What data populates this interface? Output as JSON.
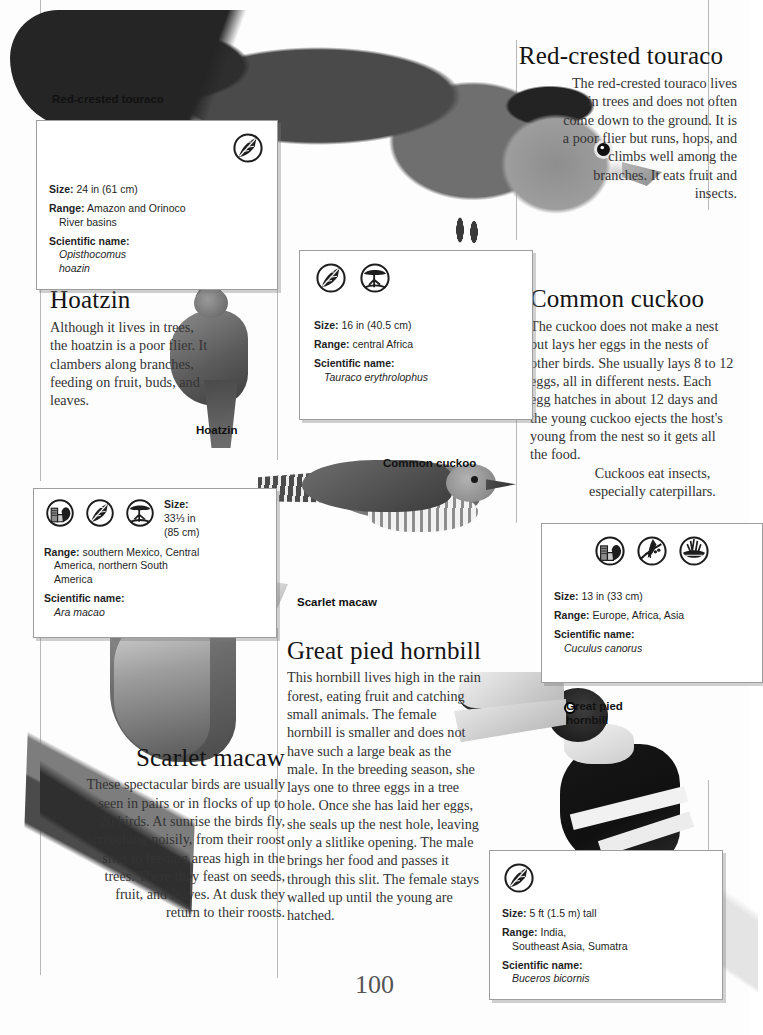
{
  "page": {
    "number": "100",
    "rules_color": "#b9b9b9"
  },
  "captions": [
    {
      "name": "caption-red-crested-touraco",
      "text": "Red-crested touraco"
    },
    {
      "name": "caption-hoatzin",
      "text": "Hoatzin"
    },
    {
      "name": "caption-common-cuckoo",
      "text": "Common cuckoo"
    },
    {
      "name": "caption-scarlet-macaw",
      "text": "Scarlet macaw"
    },
    {
      "name": "caption-great-pied-hornbill",
      "text": "Great pied\nhornbill"
    }
  ],
  "articles": {
    "touraco": {
      "title": "Red-crested touraco",
      "body": "The red-crested touraco lives in trees and does not often come down to the ground. It is a poor flier but runs, hops, and climbs well among the branches. It eats fruit and insects."
    },
    "hoatzin": {
      "title": "Hoatzin",
      "body": "Although it lives in trees, the hoatzin is a poor flier. It clambers along branches, feeding on fruit, buds, and leaves."
    },
    "cuckoo": {
      "title": "Common cuckoo",
      "body": "The cuckoo does not make a nest but lays her eggs in the nests of other birds. She usually lays 8 to 12 eggs, all in different nests. Each egg hatches in about 12 days and the young cuckoo ejects the host's young from the nest so it gets all the food.",
      "body2": "Cuckoos eat insects, especially caterpillars."
    },
    "macaw": {
      "title": "Scarlet macaw",
      "body": "These spectacular birds are usually seen in pairs or in flocks of up to 20 birds. At sunrise the birds fly, screeching noisily, from their roost sites to feeding areas high in the trees. There they feast on seeds, fruit, and leaves. At dusk they return to their roosts."
    },
    "hornbill": {
      "title": "Great pied hornbill",
      "body": "This hornbill lives high in the rain forest, eating fruit and catching small animals. The female hornbill is smaller and does not have such a large beak as the male. In the breeding season, she lays one to three eggs in a tree hole. Once she has laid her eggs, she seals up the nest hole, leaving only a slitlike opening. The male brings her food and passes it through this slit. The female stays walled up until the young are hatched."
    }
  },
  "factboxes": {
    "hoatzin": {
      "icons": [
        "rainforest-leaf-icon"
      ],
      "size_label": "Size:",
      "size_value": "24 in (61 cm)",
      "range_label": "Range:",
      "range_value": "Amazon and Orinoco",
      "range_value2": "River basins",
      "sciname_label": "Scientific name:",
      "sciname_value": "Opisthocomus",
      "sciname_value2": "hoazin"
    },
    "touraco": {
      "icons": [
        "rainforest-leaf-icon",
        "savanna-tree-icon"
      ],
      "size_label": "Size:",
      "size_value": "16 in (40.5 cm)",
      "range_label": "Range:",
      "range_value": "central Africa",
      "sciname_label": "Scientific name:",
      "sciname_value": "Tauraco erythrolophus"
    },
    "macaw": {
      "icons": [
        "town-city-icon",
        "rainforest-leaf-icon",
        "savanna-tree-icon"
      ],
      "size_label": "Size:",
      "size_value": "33⅓ in",
      "size_value2": "(85 cm)",
      "range_label": "Range:",
      "range_value": "southern Mexico, Central",
      "range_value2": "America, northern South",
      "range_value3": "America",
      "sciname_label": "Scientific name:",
      "sciname_value": "Ara macao"
    },
    "cuckoo": {
      "icons": [
        "town-city-icon",
        "woodland-icon",
        "grassland-icon"
      ],
      "size_label": "Size:",
      "size_value": "13 in (33 cm)",
      "range_label": "Range:",
      "range_value": "Europe, Africa, Asia",
      "sciname_label": "Scientific name:",
      "sciname_value": "Cuculus canorus"
    },
    "hornbill": {
      "icons": [
        "rainforest-leaf-icon"
      ],
      "size_label": "Size:",
      "size_value": "5 ft (1.5 m) tall",
      "range_label": "Range:",
      "range_value": "India,",
      "range_value2": "Southeast Asia, Sumatra",
      "sciname_label": "Scientific name:",
      "sciname_value": "Buceros bicornis"
    }
  }
}
